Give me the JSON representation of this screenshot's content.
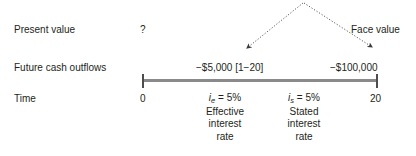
{
  "diagram": {
    "rows": [
      {
        "label": "Present value"
      },
      {
        "label": "Future cash outflows"
      },
      {
        "label": "Time"
      }
    ],
    "present_value": {
      "value": "?"
    },
    "cash_flows": {
      "periodic": "−$5,000 [1−20]",
      "face_value": "−$100,000"
    },
    "callout": {
      "face_value_label": "Face value"
    },
    "timeline": {
      "start_label": "0",
      "end_label": "20"
    },
    "rates": [
      {
        "symbol": "i",
        "subscript": "e",
        "equals": " = 5%",
        "lines": [
          "Effective",
          "interest",
          "rate"
        ]
      },
      {
        "symbol": "i",
        "subscript": "s",
        "equals": " = 5%",
        "lines": [
          "Stated",
          "interest",
          "rate"
        ]
      }
    ],
    "colors": {
      "text": "#231f20",
      "timeline_bar": "#8a8a8a",
      "tick": "#4d4d4d",
      "arrow": "#3a3a3a"
    }
  }
}
